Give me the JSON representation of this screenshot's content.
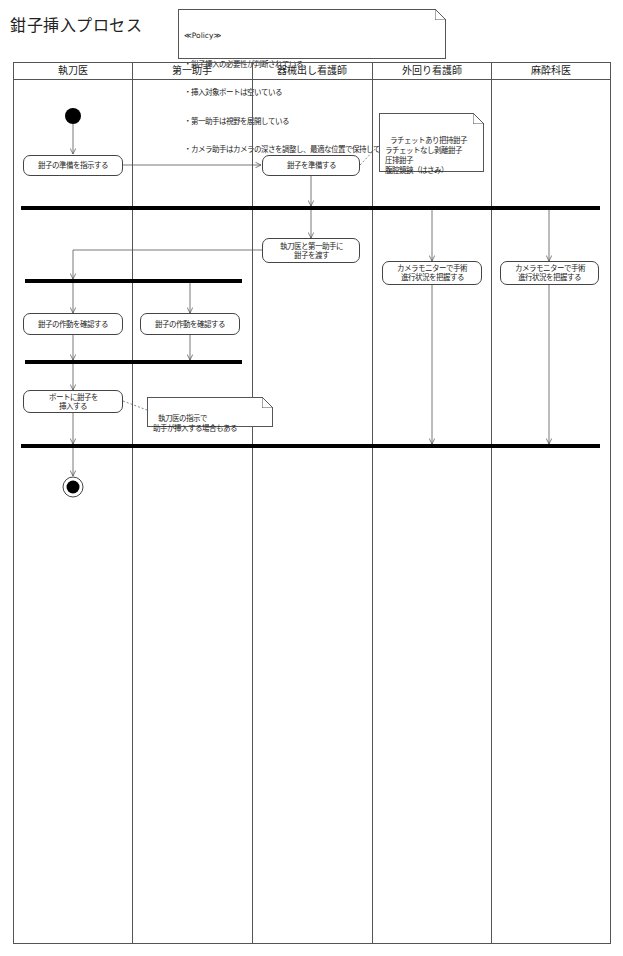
{
  "diagram": {
    "title": "鉗子挿入プロセス",
    "policy_note": {
      "stereotype": "≪Policy≫",
      "lines": [
        "・鉗子挿入の必要性が判断されている。",
        "・挿入対象ポートは空いている",
        "・第一助手は視野を展開している",
        "・カメラ助手はカメラの深さを調整し、最適な位置で保持している。"
      ]
    },
    "lanes": [
      {
        "label": "執刀医"
      },
      {
        "label": "第一助手"
      },
      {
        "label": "器械出し看護師"
      },
      {
        "label": "外回り看護師"
      },
      {
        "label": "麻酔科医"
      }
    ],
    "activities": [
      {
        "id": "a1",
        "label": "鉗子の準備を指示する"
      },
      {
        "id": "a2",
        "label": "鉗子を準備する"
      },
      {
        "id": "a3",
        "label": "執刀医と第一助手に\n鉗子を渡す"
      },
      {
        "id": "a4",
        "label": "カメラモニターで手術\n進行状況を把握する"
      },
      {
        "id": "a5",
        "label": "カメラモニターで手術\n進行状況を把握する"
      },
      {
        "id": "a6",
        "label": "鉗子の作動を確認する"
      },
      {
        "id": "a7",
        "label": "鉗子の作動を確認する"
      },
      {
        "id": "a8",
        "label": "ポートに鉗子を\n挿入する"
      }
    ],
    "notes": [
      {
        "id": "n1",
        "text": "ラチェットあり把持鉗子\nラチェットなし剥離鉗子\n圧排鉗子\n腹腔鏡鋏（はさみ）"
      },
      {
        "id": "n2",
        "text": "執刀医の指示で\n助手が挿入する場合もある"
      }
    ],
    "nodes": {
      "initial": "initial-node",
      "final": "final-node"
    },
    "colors": {
      "line": "#555555",
      "bar": "#000000",
      "background": "#ffffff"
    }
  }
}
